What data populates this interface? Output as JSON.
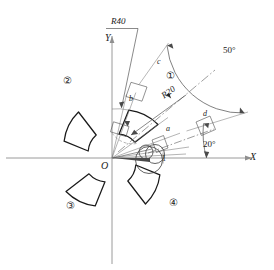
{
  "drawing": {
    "title": "Circular pattern of annular sector about origin",
    "stroke_color": "#1a1a1a",
    "thin_color": "#6e6e6e",
    "axis_color": "#8a8a8a",
    "background": "#ffffff",
    "origin": {
      "x": 112,
      "y": 158,
      "label": "O"
    },
    "axes": {
      "x_label": "X",
      "y_label": "Y",
      "x_start": {
        "x": 6,
        "y": 158
      },
      "x_end": {
        "x": 258,
        "y": 158
      },
      "y_start": {
        "x": 112,
        "y": 262
      },
      "y_end": {
        "x": 112,
        "y": 30
      }
    },
    "geometry": {
      "inner_radius": 20,
      "outer_radius": 40,
      "start_angle_deg": 20,
      "sweep_angle_deg": 50,
      "pattern_count": 4,
      "pattern_step_deg": 90,
      "px_per_unit": 2.45
    },
    "dimensions": [
      {
        "name": "outer-radius",
        "text": "R40"
      },
      {
        "name": "inner-radius",
        "text": "R20"
      },
      {
        "name": "sector-sweep",
        "text": "50°"
      },
      {
        "name": "start-angle",
        "text": "20°"
      }
    ],
    "point_labels": [
      {
        "id": "a",
        "text": "a"
      },
      {
        "id": "b",
        "text": "b"
      },
      {
        "id": "c",
        "text": "c"
      },
      {
        "id": "d",
        "text": "d"
      },
      {
        "id": "one",
        "text": "1"
      }
    ],
    "sector_labels": [
      {
        "id": "s1",
        "text": "①"
      },
      {
        "id": "s2",
        "text": "②"
      },
      {
        "id": "s3",
        "text": "③"
      },
      {
        "id": "s4",
        "text": "④"
      }
    ]
  }
}
